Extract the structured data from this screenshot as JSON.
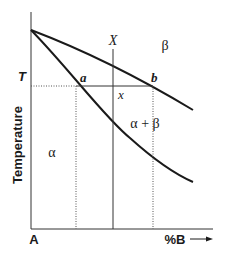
{
  "diagram": {
    "type": "binary-phase-diagram",
    "axes": {
      "y_label": "Temperature",
      "y_tick_label": "T",
      "x_origin_label": "A",
      "x_label": "%B",
      "x_arrow": "arrow-right"
    },
    "regions": {
      "alpha": "α",
      "beta": "β",
      "two_phase": "α + β"
    },
    "points": {
      "a": "a",
      "b": "b",
      "x": "x",
      "composition": "X"
    },
    "colors": {
      "line": "#1a1a1a",
      "dotted": "#555555",
      "background": "#ffffff"
    }
  }
}
